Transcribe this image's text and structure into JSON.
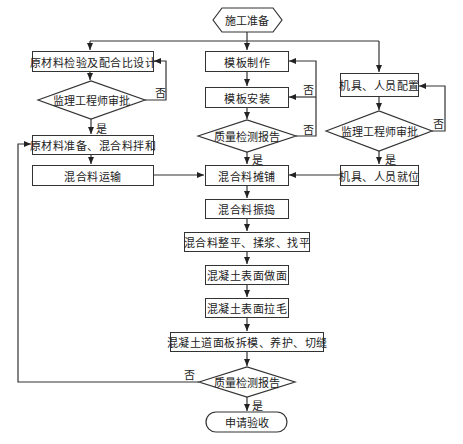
{
  "start": {
    "label": "施工准备"
  },
  "left": {
    "design": "原材料检验及配合比设计",
    "approve": "监理工程师审批",
    "mix": "原材料准备、混合料拌和",
    "transport": "混合料运输"
  },
  "center": {
    "form_make": "模板制作",
    "form_install": "模板安装",
    "quality1": "质量检测报告",
    "paving": "混合料摊铺",
    "vibrating": "混合料振捣",
    "leveling": "混合料整平、揉浆、找平",
    "surface_finish": "混凝土表面做面",
    "surface_texture": "混凝土表面拉毛",
    "demold": "混凝土道面板拆模、养护、切缝",
    "quality2": "质量检测报告",
    "end": "申请验收"
  },
  "right": {
    "equip_config": "机具、人员配置",
    "approve": "监理工程师审批",
    "equip_ready": "机具、人员就位"
  },
  "labels": {
    "yes": "是",
    "no": "否"
  }
}
